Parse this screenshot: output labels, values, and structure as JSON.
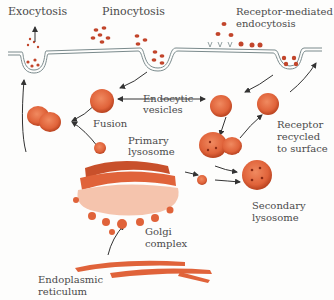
{
  "labels": {
    "exocytosis": "Exocytosis",
    "pinocytosis": "Pinocytosis",
    "receptor_mediated_1": "Receptor-mediated",
    "receptor_mediated_2": "endocytosis",
    "endocytic_1": "Endocytic",
    "endocytic_2": "vesicles",
    "fusion": "Fusion",
    "primary_1": "Primary",
    "primary_2": "lysosome",
    "receptor_recycled_1": "Receptor",
    "receptor_recycled_2": "recycled",
    "receptor_recycled_3": "to surface",
    "secondary_1": "Secondary",
    "secondary_2": "lysosome",
    "golgi_1": "Golgi",
    "golgi_2": "complex",
    "er_1": "Endoplasmic",
    "er_2": "reticulum"
  },
  "colors": {
    "organelle": "#e0633a",
    "organelle_dark": "#b8421f",
    "organelle_light": "#f2a486",
    "particle": "#c2452b",
    "membrane": "#7a8a8c",
    "arrow": "#333333",
    "text": "#4a4a4a"
  }
}
